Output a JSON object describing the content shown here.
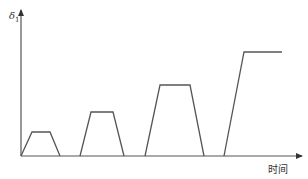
{
  "chart_data": {
    "type": "line",
    "title": "",
    "xlabel": "时间",
    "ylabel": "δ1",
    "ylabel_main": "δ",
    "ylabel_sub": "1",
    "grid": false,
    "legend": null,
    "series": [
      {
        "name": "pulse-1",
        "points": [
          [
            0,
            0
          ],
          [
            11,
            24
          ],
          [
            29,
            24
          ],
          [
            39,
            0
          ]
        ]
      },
      {
        "name": "pulse-2",
        "points": [
          [
            59,
            0
          ],
          [
            70,
            44
          ],
          [
            92,
            44
          ],
          [
            103,
            0
          ]
        ]
      },
      {
        "name": "pulse-3",
        "points": [
          [
            124,
            0
          ],
          [
            139,
            71
          ],
          [
            169,
            71
          ],
          [
            183,
            0
          ]
        ]
      },
      {
        "name": "pulse-4",
        "points": [
          [
            203,
            0
          ],
          [
            223,
            104
          ],
          [
            261,
            104
          ]
        ]
      }
    ],
    "axes": {
      "origin_px": [
        21,
        156
      ],
      "x_axis_end_px": 302,
      "y_axis_top_px": 10
    }
  },
  "colors": {
    "line": "#555555",
    "axis": "#555555",
    "text": "#333333"
  }
}
